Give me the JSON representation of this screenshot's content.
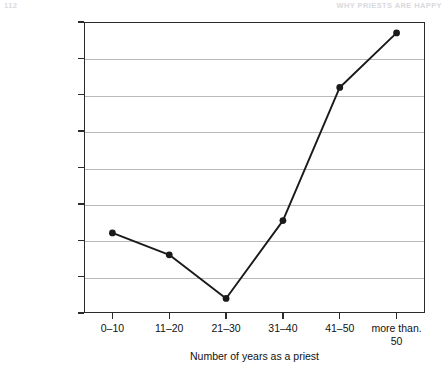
{
  "page": {
    "header_left": "112",
    "header_right": "WHY PRIESTS ARE HAPPY"
  },
  "chart_data": {
    "type": "line",
    "title": "",
    "categories": [
      "0–10",
      "11–20",
      "21–30",
      "31–40",
      "41–50",
      "more than. 50"
    ],
    "values": [
      4.21,
      4.18,
      4.12,
      4.227,
      4.41,
      4.485
    ],
    "xlabel": "Number of years as a priest",
    "ylabel": "Mean of “Growing up, I had a good relationship with my mother”",
    "ylim": [
      4.1,
      4.5
    ],
    "ytick_labels": [
      "4.5",
      "4.45",
      "4.4",
      "4.35",
      "4.3",
      "4.25",
      "4.2",
      "4.15",
      "4.1"
    ],
    "ytick_values": [
      4.5,
      4.45,
      4.4,
      4.35,
      4.3,
      4.25,
      4.2,
      4.15,
      4.1
    ],
    "grid": "horizontal",
    "legend": "none",
    "marker": "filled-circle",
    "line_color": "#1a1a1a",
    "marker_color": "#1a1a1a",
    "grid_color": "#b9b9b9",
    "axis_color": "#2b2b2b",
    "background": "#ffffff"
  }
}
